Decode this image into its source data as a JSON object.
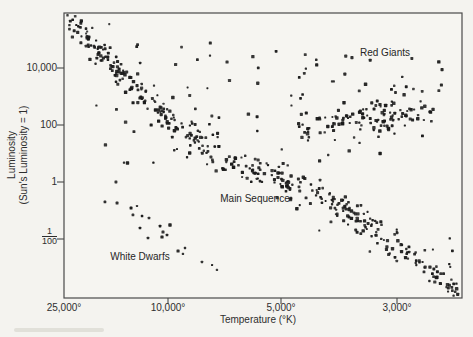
{
  "figure": {
    "background": "#f4f3ef",
    "frame_color": "#4a4a4a",
    "text_color": "#2e2e2e"
  },
  "chart_data": {
    "type": "scatter",
    "title": "",
    "xlabel": "Temperature (°K)",
    "ylabel_line1": "Luminosity",
    "ylabel_line2": "(Sun's Luminosity = 1)",
    "x_direction": "reversed",
    "grid": false,
    "legend": "none",
    "plot_area": {
      "left": 64,
      "top": 13,
      "right": 462,
      "bottom": 298
    },
    "x_ticks": [
      {
        "label": "25,000°",
        "px": 64,
        "tick": false
      },
      {
        "label": "10,000°",
        "px": 168,
        "tick": true
      },
      {
        "label": "5,000°",
        "px": 281,
        "tick": true
      },
      {
        "label": "3,000°",
        "px": 397,
        "tick": true
      }
    ],
    "y_ticks": [
      {
        "label": "10,000",
        "py": 68,
        "tick": true
      },
      {
        "label": "100",
        "py": 125,
        "tick": true
      },
      {
        "label": "1",
        "py": 182,
        "tick": true
      },
      {
        "label": "1/100",
        "py": 239,
        "tick": true,
        "num": "1",
        "den": "100"
      }
    ],
    "annotations": [
      {
        "text": "Red Giants",
        "x": 385,
        "y": 52
      },
      {
        "text": "Main Sequence",
        "x": 255,
        "y": 198
      },
      {
        "text": "White Dwarfs",
        "x": 140,
        "y": 256
      }
    ],
    "point_color": "#1a1a1a",
    "scatter_spec": {
      "seed": 7,
      "main_sequence": {
        "count": 430,
        "outlier_fraction": 0.1,
        "outlier_spread": 3.0,
        "ridge": [
          [
            66,
            16
          ],
          [
            88,
            40
          ],
          [
            110,
            62
          ],
          [
            132,
            84
          ],
          [
            154,
            105
          ],
          [
            176,
            125
          ],
          [
            198,
            143
          ],
          [
            220,
            157
          ],
          [
            242,
            167
          ],
          [
            264,
            174
          ],
          [
            286,
            181
          ],
          [
            308,
            191
          ],
          [
            330,
            202
          ],
          [
            352,
            214
          ],
          [
            374,
            228
          ],
          [
            396,
            244
          ],
          [
            418,
            261
          ],
          [
            440,
            279
          ],
          [
            458,
            294
          ]
        ],
        "sigma": [
          4,
          4,
          4,
          5,
          5,
          6,
          7,
          8,
          8,
          8,
          8,
          8,
          7,
          7,
          6,
          6,
          5,
          5,
          4
        ],
        "weights": [
          1.5,
          1.3,
          1.1,
          1,
          1,
          1.1,
          1.2,
          1.5,
          1.7,
          1.6,
          1.5,
          1.4,
          1.3,
          1.2,
          1.1,
          1,
          1,
          0.9
        ]
      },
      "red_giants": {
        "count": 130,
        "outlier_fraction": 0.12,
        "outlier_spread": 2.2,
        "ridge": [
          [
            298,
            130
          ],
          [
            322,
            124
          ],
          [
            346,
            119
          ],
          [
            370,
            116
          ],
          [
            394,
            113
          ],
          [
            418,
            112
          ],
          [
            434,
            112
          ]
        ],
        "sigma": [
          7,
          8,
          9,
          9,
          9,
          8,
          7
        ],
        "weights": [
          0.8,
          1,
          1.3,
          1.4,
          1.2,
          1
        ]
      },
      "sparse_field": {
        "count": 55,
        "x_range": [
          85,
          355
        ],
        "y_range": [
          40,
          165
        ]
      },
      "giant_halo": {
        "count": 16,
        "x_range": [
          330,
          445
        ],
        "y_range": [
          55,
          95
        ]
      },
      "white_dwarfs_points": [
        [
          116,
          182
        ],
        [
          105,
          202
        ],
        [
          117,
          203
        ],
        [
          131,
          208
        ],
        [
          137,
          206
        ],
        [
          133,
          215
        ],
        [
          142,
          216
        ],
        [
          149,
          218
        ],
        [
          140,
          228
        ],
        [
          160,
          226
        ],
        [
          163,
          232
        ],
        [
          170,
          225
        ],
        [
          148,
          238
        ],
        [
          162,
          237
        ],
        [
          167,
          235
        ],
        [
          178,
          251
        ],
        [
          185,
          248
        ],
        [
          183,
          254
        ],
        [
          202,
          262
        ],
        [
          212,
          265
        ],
        [
          217,
          270
        ]
      ]
    }
  }
}
